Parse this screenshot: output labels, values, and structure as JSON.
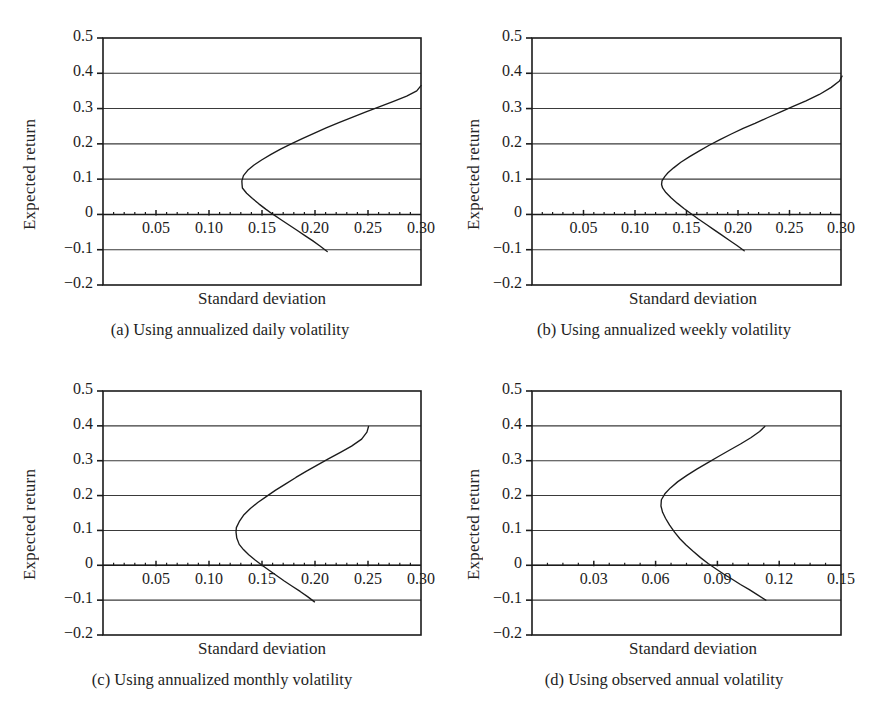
{
  "figure": {
    "background": "#ffffff",
    "line_color": "#1b1b1b",
    "grid_color": "#3a3a3a",
    "axis_color": "#1b1b1b"
  },
  "chart_data": [
    {
      "type": "line",
      "panel_id": "a",
      "caption": "(a) Using annualized daily volatility",
      "title": "",
      "xlabel": "Standard deviation",
      "ylabel": "Expected return",
      "xlim": [
        0.0,
        0.3
      ],
      "ylim": [
        -0.2,
        0.5
      ],
      "xticks": [
        0.05,
        0.1,
        0.15,
        0.2,
        0.25,
        0.3
      ],
      "xtick_labels": [
        "0.05",
        "0.10",
        "0.15",
        "0.20",
        "0.25",
        "0.30"
      ],
      "yticks": [
        0.5,
        0.4,
        0.3,
        0.2,
        0.1,
        0.0,
        -0.1,
        -0.2
      ],
      "ytick_labels": [
        "0.5",
        "0.4",
        "0.3",
        "0.2",
        "0.1",
        "0",
        "−0.1",
        "−0.2"
      ],
      "grid": "horizontal",
      "legend": "none",
      "minimum_variance_point": {
        "x": 0.131,
        "y": 0.095
      },
      "series": [
        {
          "name": "efficient frontier (annualized daily volatility)",
          "points": [
            [
              0.2115,
              -0.105
            ],
            [
              0.205,
              -0.09
            ],
            [
              0.198,
              -0.075
            ],
            [
              0.1905,
              -0.06
            ],
            [
              0.183,
              -0.045
            ],
            [
              0.1755,
              -0.03
            ],
            [
              0.168,
              -0.015
            ],
            [
              0.1605,
              0.0
            ],
            [
              0.1535,
              0.015
            ],
            [
              0.147,
              0.03
            ],
            [
              0.141,
              0.045
            ],
            [
              0.1355,
              0.06
            ],
            [
              0.1315,
              0.075
            ],
            [
              0.1312,
              0.085
            ],
            [
              0.131,
              0.095
            ],
            [
              0.1325,
              0.11
            ],
            [
              0.1365,
              0.125
            ],
            [
              0.1425,
              0.14
            ],
            [
              0.15,
              0.155
            ],
            [
              0.1585,
              0.17
            ],
            [
              0.1675,
              0.185
            ],
            [
              0.1775,
              0.2
            ],
            [
              0.188,
              0.215
            ],
            [
              0.199,
              0.23
            ],
            [
              0.2105,
              0.245
            ],
            [
              0.2225,
              0.26
            ],
            [
              0.235,
              0.275
            ],
            [
              0.2475,
              0.29
            ],
            [
              0.2605,
              0.305
            ],
            [
              0.2735,
              0.32
            ],
            [
              0.2865,
              0.335
            ],
            [
              0.296,
              0.35
            ],
            [
              0.3,
              0.365
            ]
          ]
        }
      ]
    },
    {
      "type": "line",
      "panel_id": "b",
      "caption": "(b) Using annualized weekly volatility",
      "title": "",
      "xlabel": "Standard deviation",
      "ylabel": "Expected return",
      "xlim": [
        0.0,
        0.3
      ],
      "ylim": [
        -0.2,
        0.5
      ],
      "xticks": [
        0.05,
        0.1,
        0.15,
        0.2,
        0.25,
        0.3
      ],
      "xtick_labels": [
        "0.05",
        "0.10",
        "0.15",
        "0.20",
        "0.25",
        "0.30"
      ],
      "yticks": [
        0.5,
        0.4,
        0.3,
        0.2,
        0.1,
        0.0,
        -0.1,
        -0.2
      ],
      "ytick_labels": [
        "0.5",
        "0.4",
        "0.3",
        "0.2",
        "0.1",
        "0",
        "−0.1",
        "−0.2"
      ],
      "grid": "horizontal",
      "legend": "none",
      "minimum_variance_point": {
        "x": 0.126,
        "y": 0.085
      },
      "series": [
        {
          "name": "efficient frontier (annualized weekly volatility)",
          "points": [
            [
              0.206,
              -0.103
            ],
            [
              0.199,
              -0.088
            ],
            [
              0.1915,
              -0.073
            ],
            [
              0.184,
              -0.058
            ],
            [
              0.1765,
              -0.043
            ],
            [
              0.169,
              -0.028
            ],
            [
              0.1615,
              -0.013
            ],
            [
              0.1545,
              0.002
            ],
            [
              0.1475,
              0.017
            ],
            [
              0.141,
              0.032
            ],
            [
              0.135,
              0.047
            ],
            [
              0.13,
              0.062
            ],
            [
              0.1268,
              0.075
            ],
            [
              0.1258,
              0.085
            ],
            [
              0.1262,
              0.095
            ],
            [
              0.129,
              0.108
            ],
            [
              0.132,
              0.118
            ],
            [
              0.1375,
              0.132
            ],
            [
              0.1445,
              0.148
            ],
            [
              0.153,
              0.164
            ],
            [
              0.1625,
              0.18
            ],
            [
              0.172,
              0.196
            ],
            [
              0.1825,
              0.212
            ],
            [
              0.1935,
              0.228
            ],
            [
              0.205,
              0.244
            ],
            [
              0.2165,
              0.258
            ],
            [
              0.2285,
              0.274
            ],
            [
              0.241,
              0.29
            ],
            [
              0.2535,
              0.306
            ],
            [
              0.266,
              0.322
            ],
            [
              0.279,
              0.34
            ],
            [
              0.2905,
              0.36
            ],
            [
              0.2985,
              0.378
            ],
            [
              0.301,
              0.392
            ]
          ]
        }
      ]
    },
    {
      "type": "line",
      "panel_id": "c",
      "caption": "(c) Using annualized monthly volatility",
      "title": "",
      "xlabel": "Standard deviation",
      "ylabel": "Expected return",
      "xlim": [
        0.0,
        0.3
      ],
      "ylim": [
        -0.2,
        0.5
      ],
      "xticks": [
        0.05,
        0.1,
        0.15,
        0.2,
        0.25,
        0.3
      ],
      "xtick_labels": [
        "0.05",
        "0.10",
        "0.15",
        "0.20",
        "0.25",
        "0.30"
      ],
      "yticks": [
        0.5,
        0.4,
        0.3,
        0.2,
        0.1,
        0.0,
        -0.1,
        -0.2
      ],
      "ytick_labels": [
        "0.5",
        "0.4",
        "0.3",
        "0.2",
        "0.1",
        "0",
        "−0.1",
        "−0.2"
      ],
      "grid": "horizontal",
      "legend": "none",
      "minimum_variance_point": {
        "x": 0.126,
        "y": 0.105
      },
      "series": [
        {
          "name": "efficient frontier (annualized monthly volatility)",
          "points": [
            [
              0.1995,
              -0.105
            ],
            [
              0.193,
              -0.09
            ],
            [
              0.186,
              -0.075
            ],
            [
              0.1785,
              -0.06
            ],
            [
              0.171,
              -0.045
            ],
            [
              0.164,
              -0.03
            ],
            [
              0.157,
              -0.015
            ],
            [
              0.15,
              0.0
            ],
            [
              0.1435,
              0.015
            ],
            [
              0.1375,
              0.03
            ],
            [
              0.1325,
              0.045
            ],
            [
              0.1285,
              0.06
            ],
            [
              0.1262,
              0.078
            ],
            [
              0.1255,
              0.095
            ],
            [
              0.1258,
              0.108
            ],
            [
              0.1285,
              0.125
            ],
            [
              0.133,
              0.145
            ],
            [
              0.139,
              0.163
            ],
            [
              0.146,
              0.18
            ],
            [
              0.154,
              0.197
            ],
            [
              0.1625,
              0.215
            ],
            [
              0.172,
              0.233
            ],
            [
              0.182,
              0.252
            ],
            [
              0.192,
              0.27
            ],
            [
              0.2025,
              0.288
            ],
            [
              0.213,
              0.306
            ],
            [
              0.224,
              0.324
            ],
            [
              0.2345,
              0.342
            ],
            [
              0.244,
              0.362
            ],
            [
              0.249,
              0.382
            ],
            [
              0.2505,
              0.398
            ]
          ]
        }
      ]
    },
    {
      "type": "line",
      "panel_id": "d",
      "caption": "(d) Using observed annual volatility",
      "title": "",
      "xlabel": "Standard deviation",
      "ylabel": "Expected return",
      "xlim": [
        0.0,
        0.15
      ],
      "ylim": [
        -0.2,
        0.5
      ],
      "xticks": [
        0.03,
        0.06,
        0.09,
        0.12,
        0.15
      ],
      "xtick_labels": [
        "0.03",
        "0.06",
        "0.09",
        "0.12",
        "0.15"
      ],
      "yticks": [
        0.5,
        0.4,
        0.3,
        0.2,
        0.1,
        0.0,
        -0.1,
        -0.2
      ],
      "ytick_labels": [
        "0.5",
        "0.4",
        "0.3",
        "0.2",
        "0.1",
        "0",
        "−0.1",
        "−0.2"
      ],
      "grid": "horizontal",
      "legend": "none",
      "minimum_variance_point": {
        "x": 0.0625,
        "y": 0.17
      },
      "series": [
        {
          "name": "efficient frontier (observed annual volatility)",
          "points": [
            [
              0.1135,
              -0.1
            ],
            [
              0.1095,
              -0.085
            ],
            [
              0.1055,
              -0.07
            ],
            [
              0.1012,
              -0.055
            ],
            [
              0.0972,
              -0.04
            ],
            [
              0.093,
              -0.025
            ],
            [
              0.0892,
              -0.01
            ],
            [
              0.0855,
              0.005
            ],
            [
              0.0818,
              0.022
            ],
            [
              0.0782,
              0.04
            ],
            [
              0.0748,
              0.058
            ],
            [
              0.0718,
              0.076
            ],
            [
              0.0692,
              0.095
            ],
            [
              0.0668,
              0.115
            ],
            [
              0.0648,
              0.135
            ],
            [
              0.0634,
              0.152
            ],
            [
              0.0626,
              0.17
            ],
            [
              0.0628,
              0.188
            ],
            [
              0.0645,
              0.205
            ],
            [
              0.0672,
              0.222
            ],
            [
              0.0708,
              0.24
            ],
            [
              0.0752,
              0.258
            ],
            [
              0.08,
              0.276
            ],
            [
              0.0852,
              0.294
            ],
            [
              0.0905,
              0.312
            ],
            [
              0.0958,
              0.33
            ],
            [
              0.1012,
              0.348
            ],
            [
              0.1062,
              0.366
            ],
            [
              0.1105,
              0.384
            ],
            [
              0.113,
              0.398
            ]
          ]
        }
      ]
    }
  ]
}
